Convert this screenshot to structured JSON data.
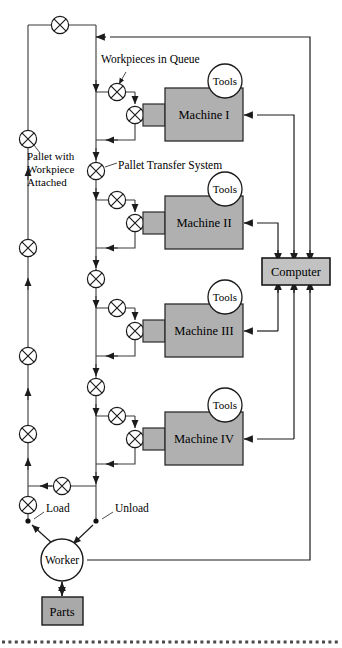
{
  "diagram": {
    "title_fragment": "",
    "colors": {
      "machine_fill": "#b0b0b0",
      "computer_fill": "#c2c2c2",
      "parts_fill": "#a9a9a9",
      "line": "#3a3a3a",
      "text": "#000000"
    },
    "annotations": [
      {
        "id": "workpieces-in-queue",
        "text": "Workpieces in Queue"
      },
      {
        "id": "pallet-with-workpiece-l1",
        "text": "Pallet with"
      },
      {
        "id": "pallet-with-workpiece-l2",
        "text": "Workpiece"
      },
      {
        "id": "pallet-with-workpiece-l3",
        "text": "Attached"
      },
      {
        "id": "pallet-transfer-system",
        "text": "Pallet Transfer System"
      },
      {
        "id": "load",
        "text": "Load"
      },
      {
        "id": "unload",
        "text": "Unload"
      }
    ],
    "machines": [
      {
        "id": "machine-1",
        "label": "Machine I",
        "tools_label": "Tools"
      },
      {
        "id": "machine-2",
        "label": "Machine II",
        "tools_label": "Tools"
      },
      {
        "id": "machine-3",
        "label": "Machine III",
        "tools_label": "Tools"
      },
      {
        "id": "machine-4",
        "label": "Machine IV",
        "tools_label": "Tools"
      }
    ],
    "nodes": [
      {
        "id": "computer",
        "label": "Computer"
      },
      {
        "id": "worker",
        "label": "Worker"
      },
      {
        "id": "parts",
        "label": "Parts"
      }
    ]
  }
}
